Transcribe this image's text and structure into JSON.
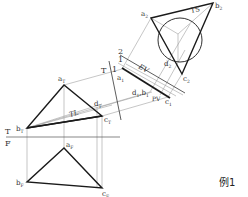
{
  "figure": {
    "caption": "例1",
    "fold_lines": {
      "top_front": {
        "top_label": "T",
        "bottom_label": "F"
      },
      "top_aux1": {
        "left_label": "T",
        "right_label": "1"
      },
      "aux1_aux2": {
        "left_label": "1",
        "right_label": "2"
      }
    },
    "annotations": {
      "true_length": "TL",
      "edge_view": "EV",
      "point_view": "PV",
      "true_shape": "TS"
    },
    "points": {
      "top_view": {
        "a": "a",
        "a_sub": "T",
        "b": "b",
        "b_sub": "T",
        "c": "c",
        "c_sub": "T",
        "d": "d",
        "d_sub": "T"
      },
      "front_view": {
        "a": "a",
        "a_sub": "F",
        "b": "b",
        "b_sub": "F",
        "c": "c",
        "c_sub": "F"
      },
      "aux_view_1": {
        "a": "a",
        "a_sub": "1",
        "c": "c",
        "c_sub": "1",
        "db": "d",
        "db_sub": "1",
        "db2": "b",
        "db2_sub": "1"
      },
      "aux_view_2": {
        "a": "a",
        "a_sub": "2",
        "b": "b",
        "b_sub": "2",
        "c": "c",
        "c_sub": "2",
        "d": "d",
        "d_sub": "2"
      }
    },
    "colors": {
      "object_line": "#1a1a1a",
      "projection_line": "#9a9a9a",
      "label": "#333333"
    }
  }
}
